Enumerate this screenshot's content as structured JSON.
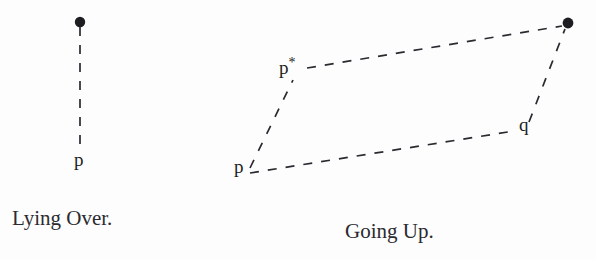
{
  "figure": {
    "width": 596,
    "height": 260,
    "background_color": "#fdfdfd",
    "ink_color": "#1d1d22",
    "panels": [
      {
        "id": "lying-over",
        "caption": "Lying Over.",
        "caption_x": 12,
        "caption_baseline_y": 225,
        "nodes": [
          {
            "id": "top-dot",
            "label": "",
            "x": 80,
            "y": 22,
            "kind": "filled-dot",
            "radius": 5.2
          },
          {
            "id": "p",
            "label": "p",
            "x": 74,
            "y": 150,
            "kind": "text"
          }
        ],
        "edges": [
          {
            "id": "p-to-dot",
            "x1": 80,
            "y1": 27,
            "x2": 80,
            "y2": 146,
            "style": "dashed"
          }
        ]
      },
      {
        "id": "going-up",
        "caption": "Going Up.",
        "caption_x": 345,
        "caption_baseline_y": 238,
        "nodes": [
          {
            "id": "top-right-dot",
            "label": "",
            "x": 568,
            "y": 23,
            "kind": "filled-dot",
            "radius": 5.4
          },
          {
            "id": "p-star",
            "label": "p",
            "superscript": "*",
            "x": 279,
            "y": 58,
            "kind": "text"
          },
          {
            "id": "q",
            "label": "q",
            "x": 519,
            "y": 115,
            "kind": "text"
          },
          {
            "id": "p-lower",
            "label": "p",
            "x": 234,
            "y": 157,
            "kind": "text"
          }
        ],
        "edges": [
          {
            "id": "p-to-pstar",
            "x1": 250,
            "y1": 168,
            "x2": 293,
            "y2": 80,
            "style": "dashed"
          },
          {
            "id": "pstar-to-dot",
            "x1": 307,
            "y1": 68,
            "x2": 562,
            "y2": 26,
            "style": "dashed"
          },
          {
            "id": "p-to-q",
            "x1": 250,
            "y1": 173,
            "x2": 514,
            "y2": 131,
            "style": "dashed"
          },
          {
            "id": "q-to-dot",
            "x1": 529,
            "y1": 122,
            "x2": 565,
            "y2": 29,
            "style": "dashed"
          }
        ]
      }
    ],
    "stroke": {
      "width": 1.7,
      "dash_array": "9 9",
      "color": "#2a2a30"
    }
  }
}
